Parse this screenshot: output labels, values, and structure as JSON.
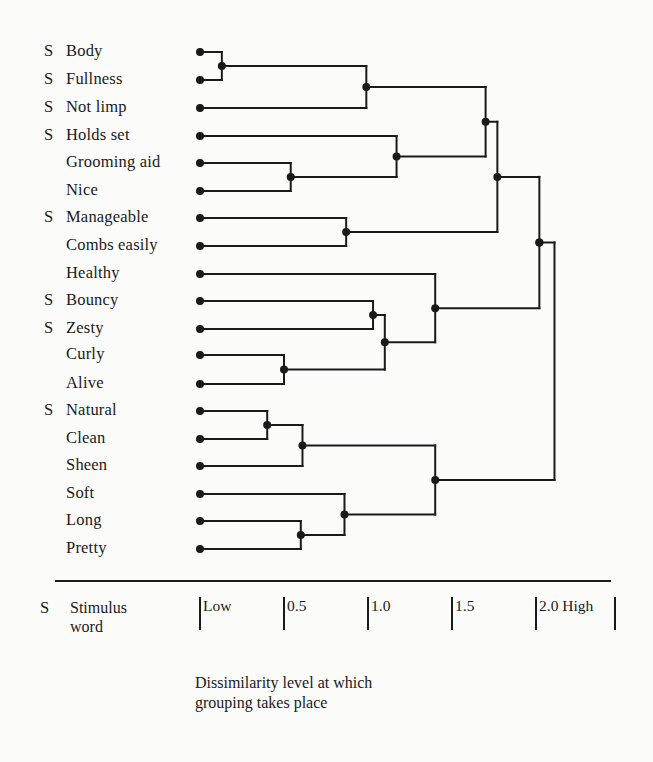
{
  "chart_data": {
    "type": "dendrogram",
    "title": "",
    "xlabel": "Dissimilarity level at which grouping takes place",
    "axis": {
      "ticks": [
        {
          "value": 0.0,
          "label": "Low"
        },
        {
          "value": 0.5,
          "label": "0.5"
        },
        {
          "value": 1.0,
          "label": "1.0"
        },
        {
          "value": 1.5,
          "label": "1.5"
        },
        {
          "value": 2.0,
          "label": "2.0 High"
        }
      ],
      "range": [
        0,
        2.5
      ]
    },
    "legend": {
      "marker": "S",
      "meaning": "Stimulus word"
    },
    "leaves": [
      {
        "label": "Body",
        "stimulus": true
      },
      {
        "label": "Fullness",
        "stimulus": true
      },
      {
        "label": "Not limp",
        "stimulus": true
      },
      {
        "label": "Holds set",
        "stimulus": true
      },
      {
        "label": "Grooming aid",
        "stimulus": false
      },
      {
        "label": "Nice",
        "stimulus": false
      },
      {
        "label": "Manageable",
        "stimulus": true
      },
      {
        "label": "Combs easily",
        "stimulus": false
      },
      {
        "label": "Healthy",
        "stimulus": false
      },
      {
        "label": "Bouncy",
        "stimulus": true
      },
      {
        "label": "Zesty",
        "stimulus": true
      },
      {
        "label": "Curly",
        "stimulus": false
      },
      {
        "label": "Alive",
        "stimulus": false
      },
      {
        "label": "Natural",
        "stimulus": true
      },
      {
        "label": "Clean",
        "stimulus": false
      },
      {
        "label": "Sheen",
        "stimulus": false
      },
      {
        "label": "Soft",
        "stimulus": false
      },
      {
        "label": "Long",
        "stimulus": false
      },
      {
        "label": "Pretty",
        "stimulus": false
      }
    ],
    "merges": [
      {
        "id": "n1",
        "children": [
          "Body",
          "Fullness"
        ],
        "height": 0.13
      },
      {
        "id": "n2",
        "children": [
          "n1",
          "Not limp"
        ],
        "height": 0.99
      },
      {
        "id": "n3",
        "children": [
          "Grooming aid",
          "Nice"
        ],
        "height": 0.54
      },
      {
        "id": "n4",
        "children": [
          "Holds set",
          "n3"
        ],
        "height": 1.17
      },
      {
        "id": "n5",
        "children": [
          "n2",
          "n4"
        ],
        "height": 1.7
      },
      {
        "id": "n6",
        "children": [
          "Manageable",
          "Combs easily"
        ],
        "height": 0.87
      },
      {
        "id": "n7",
        "children": [
          "n5",
          "n6"
        ],
        "height": 1.77
      },
      {
        "id": "n8",
        "children": [
          "Bouncy",
          "Zesty"
        ],
        "height": 1.03
      },
      {
        "id": "n9",
        "children": [
          "Curly",
          "Alive"
        ],
        "height": 0.5
      },
      {
        "id": "n10",
        "children": [
          "n8",
          "n9"
        ],
        "height": 1.1
      },
      {
        "id": "n11",
        "children": [
          "Healthy",
          "n10"
        ],
        "height": 1.4
      },
      {
        "id": "n12",
        "children": [
          "n7",
          "n11"
        ],
        "height": 2.02
      },
      {
        "id": "n13",
        "children": [
          "Natural",
          "Clean"
        ],
        "height": 0.4
      },
      {
        "id": "n14",
        "children": [
          "n13",
          "Sheen"
        ],
        "height": 0.61
      },
      {
        "id": "n15",
        "children": [
          "Long",
          "Pretty"
        ],
        "height": 0.6
      },
      {
        "id": "n16",
        "children": [
          "Soft",
          "n15"
        ],
        "height": 0.86
      },
      {
        "id": "n17",
        "children": [
          "n14",
          "n16"
        ],
        "height": 1.4
      },
      {
        "id": "n18",
        "children": [
          "n12",
          "n17"
        ],
        "height": 2.11
      }
    ]
  },
  "legend": {
    "marker": "S",
    "text": "Stimulus word"
  },
  "axis_caption": "Dissimilarity level at which grouping takes place",
  "colors": {
    "ink": "#1a1a1a",
    "background": "#fbfbfa"
  }
}
